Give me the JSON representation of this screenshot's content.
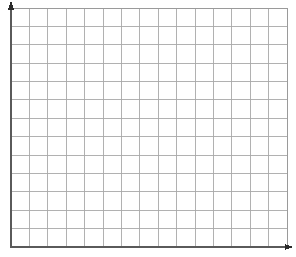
{
  "document": {
    "kind": "blank-coordinate-grid",
    "width": 296,
    "height": 257,
    "background_color": "#ffffff",
    "title": "",
    "subtitle": "",
    "visible_text": ""
  },
  "chart_data": {
    "type": "scatter",
    "title": "",
    "subtitle": "",
    "xlabel": "",
    "ylabel": "",
    "x": [],
    "values": [],
    "series": [],
    "categories": [],
    "xtick_labels": [],
    "ytick_labels": [],
    "annotations": [],
    "legend_entries": [],
    "legend_position": "none",
    "grid": true,
    "notes": "Empty graph-paper style coordinate plane: no plotted data, no numeric tick labels, no legend, no title."
  },
  "axes": {
    "x_axis": {
      "name": "x-axis",
      "color": "#5a5a5a",
      "stroke_width": 1.6,
      "x1": 11,
      "y1": 247,
      "x2": 289,
      "y2": 247,
      "arrow": {
        "name": "arrowhead-right",
        "tip_x": 293,
        "tip_y": 247,
        "size": 5,
        "color": "#2b2b2b"
      }
    },
    "y_axis": {
      "name": "y-axis",
      "color": "#5a5a5a",
      "stroke_width": 1.6,
      "x1": 11,
      "y1": 247,
      "x2": 11,
      "y2": 5,
      "arrow": {
        "name": "arrowhead-up",
        "tip_x": 11,
        "tip_y": 1,
        "size": 5,
        "color": "#2b2b2b"
      }
    }
  },
  "grid": {
    "line_color": "#a8a8a8",
    "line_width": 0.9,
    "border_color": "#9a9a9a",
    "border_width": 1,
    "left": 11,
    "top": 8,
    "right": 287,
    "bottom": 247,
    "columns": 15,
    "rows": 13,
    "cell_width": 18.4,
    "cell_height": 18.38,
    "vertical_lines_x": [
      11,
      29.4,
      47.8,
      66.2,
      84.6,
      103,
      121.4,
      139.8,
      158.2,
      176.6,
      195,
      213.4,
      231.8,
      250.2,
      268.6,
      287
    ],
    "horizontal_lines_y": [
      8,
      26.4,
      44.8,
      63.1,
      81.5,
      99.9,
      118.3,
      136.6,
      155,
      173.4,
      191.8,
      210.1,
      228.5,
      247
    ]
  }
}
